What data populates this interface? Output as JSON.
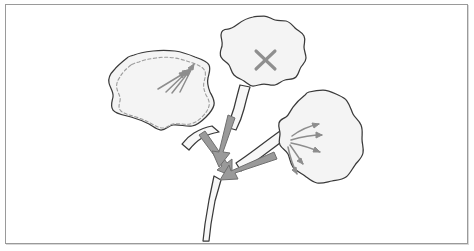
{
  "figure": {
    "caption": "",
    "background_color": "#ffffff",
    "frame_color": "#9a9a9a",
    "frame_shadow_color": "#d8d8d8"
  },
  "style": {
    "lamina_fill": "#f4f4f4",
    "lamina_stroke": "#3a3a3a",
    "petiole_fill": "#f7f7f7",
    "petiole_stroke": "#3a3a3a",
    "stem_fill": "#f7f7f7",
    "dashed_contour_stroke": "#9c9c9c",
    "thin_arrow_color": "#8d8d8d",
    "thick_arrow_fill": "#9a9a9a",
    "thick_arrow_stroke": "#6f6f6f",
    "x_mark_color": "#8f8f8f"
  },
  "plant": {
    "stem": {
      "label": "main-stem",
      "outline": "M 214 176 L 209 200 L 205 224 L 203 241 L 209 241 L 211 224 L 215 201 L 221 180 Z"
    },
    "leaves": [
      {
        "id": "left-leaf",
        "label": "Left leaf — source leaf with dashed contour",
        "position": "left",
        "has_dashed_contour": true,
        "has_x_mark": false,
        "arrow_count": 4,
        "arrow_direction": "toward leaf tip (up-right)",
        "lamina_path": "M 127 58 C 122 62 117 66 114 70 C 110 74 108 78 109 83 C 110 88 114 92 113 97 C 112 102 110 106 113 110 C 116 114 124 115 131 117 C 138 119 143 121 149 124 C 154 127 157 130 161 130 C 166 130 168 126 173 125 C 179 124 186 127 192 126 C 198 125 202 121 206 117 C 210 113 213 109 214 105 C 215 100 212 96 210 92 C 208 87 207 82 208 78 C 209 73 211 69 209 65 C 207 61 201 59 195 57 C 188 54 182 52 175 51 C 167 50 160 50 153 51 C 145 52 139 53 134 55 C 130 56 128 57 127 58 Z",
        "dashed_path": "M 131 65 C 126 69 122 73 120 77 C 117 81 116 85 117 89 C 118 93 121 97 120 101 C 119 105 118 108 121 111 C 124 114 130 115 136 117 C 142 119 147 121 152 124 C 156 126 159 128 163 128 C 167 128 169 125 173 124 C 179 123 185 125 190 124 C 195 123 199 120 202 117 C 206 113 208 110 209 106 C 210 102 208 98 206 95 C 204 90 203 86 204 82 C 205 78 206 74 205 71 C 203 67 198 65 193 63 C 187 61 181 59 175 58 C 168 57 162 57 156 58 C 149 59 143 60 139 62 C 135 63 132 64 131 65 Z",
        "petiole_path": "M 212 126 C 206 127 199 130 194 133 C 189 136 185 140 182 144 L 189 150 C 193 145 197 141 202 138 C 207 135 213 133 219 132 Z",
        "arrows": [
          {
            "id": "left-arrow-1",
            "d": "M 158 89 L 186 72",
            "head": "M 186 72 L 179 73 L 182 78 Z"
          },
          {
            "id": "left-arrow-2",
            "d": "M 166 92 L 189 70",
            "head": "M 189 70 L 182 71 L 185 76 Z"
          },
          {
            "id": "left-arrow-3",
            "d": "M 172 93 L 191 69",
            "head": "M 191 69 L 184 71 L 188 76 Z"
          },
          {
            "id": "left-arrow-4",
            "d": "M 180 92 L 194 64",
            "head": "M 194 64 L 188 68 L 193 70 Z"
          }
        ]
      },
      {
        "id": "top-leaf",
        "label": "Top leaf — marked with X (excluded / darkened)",
        "position": "top",
        "has_dashed_contour": false,
        "has_x_mark": true,
        "arrow_count": 0,
        "arrow_direction": "none",
        "lamina_path": "M 253 17 C 247 18 242 21 238 24 C 234 27 231 29 228 29 C 224 29 221 31 221 35 C 221 39 223 42 222 46 C 221 50 219 53 221 57 C 223 61 227 62 229 65 C 231 68 231 72 234 75 C 237 78 241 79 244 81 C 247 83 249 86 253 86 C 257 86 260 84 264 84 C 268 84 271 86 275 85 C 279 84 281 81 285 80 C 289 79 293 80 296 77 C 299 74 299 70 301 67 C 303 64 306 62 306 58 C 306 54 304 51 304 47 C 304 43 306 40 304 36 C 302 32 298 31 295 28 C 292 25 290 22 286 21 C 282 20 279 21 275 20 C 271 19 268 16 264 16 C 260 16 256 16 253 17 Z",
        "petiole_path": "M 240 85 C 238 92 236 100 234 108 C 232 116 229 122 226 127 L 236 130 C 239 124 242 117 244 109 C 246 101 248 93 250 87 Z",
        "x_mark": {
          "label": "X",
          "line1": "M 256 51 L 275 69",
          "line2": "M 275 51 L 256 69"
        },
        "arrows": []
      },
      {
        "id": "right-leaf",
        "label": "Right leaf — sink leaf receiving assimilates",
        "position": "right",
        "has_dashed_contour": false,
        "has_x_mark": false,
        "arrow_count": 5,
        "arrow_direction": "away from petiole into lamina (fanning right)",
        "lamina_path": "M 305 95 C 300 99 296 103 293 107 C 290 111 289 115 286 117 C 283 119 280 119 279 123 C 278 127 280 130 280 134 C 280 138 278 141 280 145 C 282 149 286 150 288 154 C 290 158 290 163 293 167 C 296 171 301 173 305 176 C 309 179 312 182 317 183 C 322 184 327 182 332 181 C 337 180 342 180 346 177 C 350 174 352 169 355 165 C 358 161 362 158 363 153 C 364 148 362 144 362 139 C 362 134 363 130 361 125 C 359 120 355 118 353 114 C 351 110 350 105 347 101 C 344 97 340 96 336 94 C 332 92 328 90 323 90 C 318 90 313 91 309 92 C 306 93 306 94 305 95 Z",
        "petiole_path": "M 280 131 C 273 136 265 142 257 148 C 249 154 242 159 236 163 L 241 171 C 248 166 256 161 264 155 C 272 149 279 144 285 139 Z",
        "arrows": [
          {
            "id": "right-arrow-1",
            "d": "M 292 136 C 300 130 309 126 319 124",
            "head": "M 319 124 L 312 123 L 314 128 Z"
          },
          {
            "id": "right-arrow-2",
            "d": "M 291 140 C 301 137 312 135 322 135",
            "head": "M 322 135 L 316 132 L 316 138 Z"
          },
          {
            "id": "right-arrow-3",
            "d": "M 291 143 C 301 145 311 148 320 152",
            "head": "M 320 152 L 315 147 L 313 152 Z"
          },
          {
            "id": "right-arrow-4",
            "d": "M 290 145 C 295 152 299 158 303 164",
            "head": "M 303 164 L 301 158 L 297 161 Z"
          },
          {
            "id": "right-arrow-5",
            "d": "M 288 147 C 290 157 293 166 297 174",
            "head": "M 297 174 L 296 167 L 292 170 Z"
          }
        ]
      }
    ],
    "transport_arrows": [
      {
        "id": "transport-arrow-from-left",
        "label": "Thick arrow from left petiole down to stem node",
        "path": "M 199 135 L 205 131 L 227 163 L 232 159 L 232 176 L 217 170 L 222 166 Z"
      },
      {
        "id": "transport-arrow-from-top",
        "label": "Thick arrow from top petiole down to stem node",
        "path": "M 228 115 L 235 118 L 223 152 L 230 153 L 219 167 L 212 151 L 219 152 Z"
      },
      {
        "id": "transport-arrow-from-right",
        "label": "Thick arrow from right petiole down-left to stem node",
        "path": "M 274 152 L 277 159 L 235 173 L 238 179 L 220 180 L 229 165 L 231 171 Z"
      }
    ]
  }
}
